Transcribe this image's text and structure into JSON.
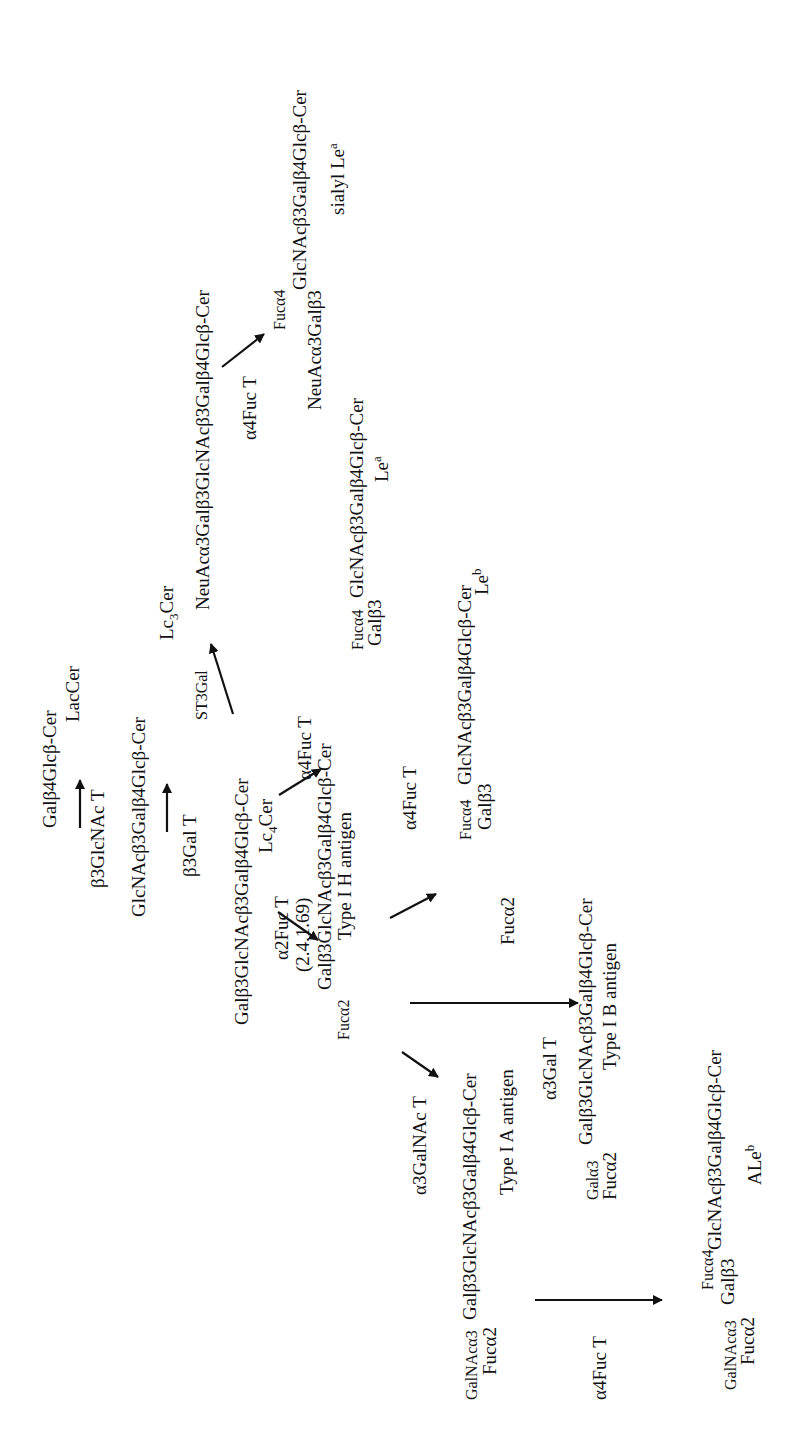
{
  "diagram": {
    "type": "biosynthetic pathway (rotated 90° counter-clockwise)",
    "nodes": {
      "lac": {
        "chain": "Galβ4Glcβ-Cer",
        "name": "LacCer"
      },
      "lc3": {
        "chain": "GlcNAcβ3Galβ4Glcβ-Cer",
        "name_base": "Lc",
        "name_sub": "3",
        "name_tail": "Cer"
      },
      "lc4": {
        "chain": "Galβ3GlcNAcβ3Galβ4Glcβ-Cer",
        "name_base": "Lc",
        "name_sub": "4",
        "name_tail": "Cer"
      },
      "sialyl_lc4": {
        "chain": "NeuAcα3Galβ3GlcNAcβ3Galβ4Glcβ-Cer"
      },
      "sialyl_lea": {
        "branch_top": "Fucα4",
        "prefix": "NeuAcα3Galβ3",
        "chain": "GlcNAcβ3Galβ4Glcβ-Cer",
        "name_base": "sialyl Le",
        "name_sup": "a"
      },
      "lea": {
        "branch_top": "Fucα4",
        "prefix": "Galβ3",
        "chain": "GlcNAcβ3Galβ4Glcβ-Cer",
        "name_base": "Le",
        "name_sup": "a"
      },
      "type1h": {
        "branch": "Fucα2",
        "chain": "Galβ3GlcNAcβ3Galβ4Glcβ-Cer",
        "name": "Type I H antigen"
      },
      "leb": {
        "branch_top": "Fucα4",
        "prefix": "Galβ3",
        "branch_bottom": "Fucα2",
        "chain": "GlcNAcβ3Galβ4Glcβ-Cer",
        "name_base": "Le",
        "name_sup": "b"
      },
      "type1b": {
        "branch_top": "Galα3",
        "branch_bottom": "Fucα2",
        "chain": "Galβ3GlcNAcβ3Galβ4Glcβ-Cer",
        "name": "Type I B antigen"
      },
      "type1a": {
        "branch_top": "GalNAcα3",
        "branch_bottom": "Fucα2",
        "chain": "Galβ3GlcNAcβ3Galβ4Glcβ-Cer",
        "name": "Type I A antigen"
      },
      "aleb": {
        "branch_top": "Fucα4",
        "prefix_top": "GalNAcα3",
        "prefix": "Galβ3",
        "branch_bottom": "Fucα2",
        "chain": "GlcNAcβ3Galβ4Glcβ-Cer",
        "name_base": "ALe",
        "name_sup": "b"
      }
    },
    "enzymes": {
      "b3glcnac": "β3GlcNAc T",
      "b3gal": "β3Gal T",
      "st3gal": "ST3Gal",
      "a4fuc_sialyl": "α4Fuc T",
      "a4fuc_lea": "α4Fuc T",
      "a2fuc": "α2Fuc T",
      "a2fuc_ec": "(2.4.1.69)",
      "a4fuc_leb": "α4Fuc T",
      "a3gal": "α3Gal T",
      "a3galnac": "α3GalNAc T",
      "a4fuc_aleb": "α4Fuc T"
    },
    "edges": [
      {
        "from": "LacCer",
        "to": "Lc3Cer",
        "enzyme": "β3GlcNAc T"
      },
      {
        "from": "Lc3Cer",
        "to": "Lc4Cer",
        "enzyme": "β3Gal T"
      },
      {
        "from": "Lc4Cer",
        "to": "Sialyl Lc4",
        "enzyme": "ST3Gal"
      },
      {
        "from": "Sialyl Lc4",
        "to": "sialyl Le^a",
        "enzyme": "α4Fuc T"
      },
      {
        "from": "Lc4Cer",
        "to": "Le^a",
        "enzyme": "α4Fuc T"
      },
      {
        "from": "Lc4Cer",
        "to": "Type I H antigen",
        "enzyme": "α2Fuc T (2.4.1.69)"
      },
      {
        "from": "Type I H antigen",
        "to": "Le^b",
        "enzyme": "α4Fuc T"
      },
      {
        "from": "Type I H antigen",
        "to": "Type I B antigen",
        "enzyme": "α3Gal T"
      },
      {
        "from": "Type I H antigen",
        "to": "Type I A antigen",
        "enzyme": "α3GalNAc T"
      },
      {
        "from": "Type I A antigen",
        "to": "ALe^b",
        "enzyme": "α4Fuc T"
      }
    ],
    "colors": {
      "ink": "#111111",
      "background": "#ffffff"
    }
  }
}
